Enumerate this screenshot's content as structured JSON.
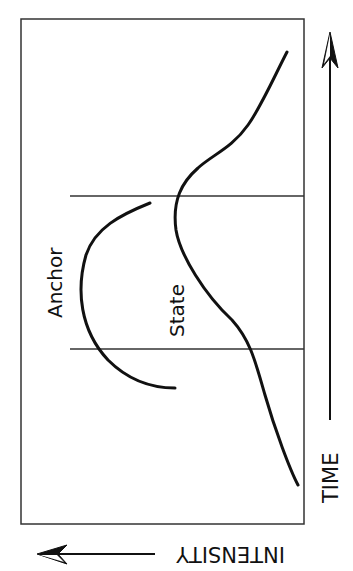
{
  "diagram": {
    "labels": {
      "anchor": "Anchor",
      "state": "State",
      "time_axis": "TIME",
      "intensity_axis": "INTENSITY"
    },
    "colors": {
      "line": "#111111",
      "frame": "#333333",
      "background": "#ffffff"
    }
  }
}
